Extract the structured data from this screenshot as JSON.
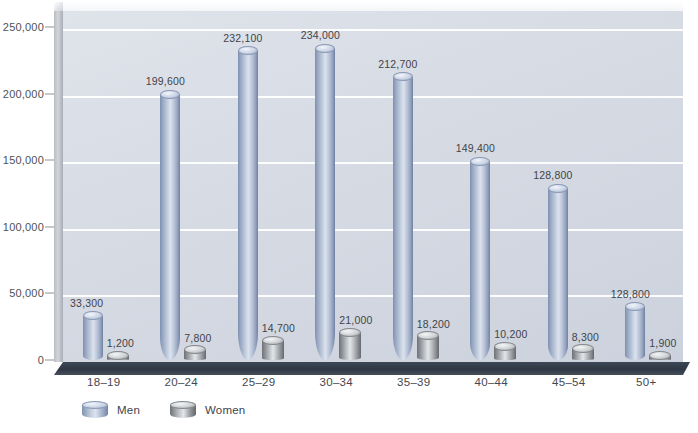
{
  "chart_data": {
    "type": "bar",
    "title": "",
    "subtitle": "",
    "xlabel": "",
    "ylabel": "",
    "categories": [
      "18–19",
      "20–24",
      "25–29",
      "30–34",
      "35–39",
      "40–44",
      "45–54",
      "50+"
    ],
    "series": [
      {
        "name": "Men",
        "color": "#a8b6cf",
        "values": [
          33300,
          199600,
          232100,
          234000,
          212700,
          149400,
          128800,
          40000
        ],
        "labels": [
          "33,300",
          "199,600",
          "232,100",
          "234,000",
          "212,700",
          "149,400",
          "128,800",
          "128,800"
        ]
      },
      {
        "name": "Women",
        "color": "#9a9da1",
        "values": [
          1200,
          7800,
          14700,
          21000,
          18200,
          10200,
          8300,
          1900
        ],
        "labels": [
          "1,200",
          "7,800",
          "14,700",
          "21,000",
          "18,200",
          "10,200",
          "8,300",
          "1,900"
        ]
      }
    ],
    "ylim": [
      0,
      262000
    ],
    "yticks": [
      0,
      50000,
      100000,
      150000,
      200000,
      250000
    ],
    "ytick_labels": [
      "0",
      "50,000",
      "100,000",
      "150,000",
      "200,000",
      "250,000"
    ],
    "grid": true,
    "legend_position": "bottom-left",
    "style": "3d-cylinder"
  },
  "legend": {
    "items": [
      {
        "label": "Men"
      },
      {
        "label": "Women"
      }
    ]
  }
}
